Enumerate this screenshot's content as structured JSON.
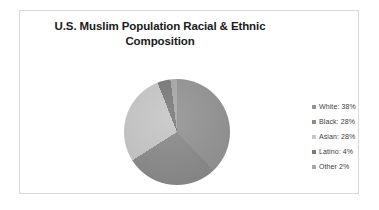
{
  "chart": {
    "title": "U.S. Muslim Population Racial & Ethnic Composition",
    "frame_border_color": "#d9d9d9",
    "background": "#ffffff"
  },
  "legend": {
    "position": "right",
    "items": [
      {
        "label": "White: 38%",
        "color": "#949494",
        "marker": "square-marker"
      },
      {
        "label": "Black: 28%",
        "color": "#8a8a8a",
        "marker": "square-marker"
      },
      {
        "label": "Asian: 28%",
        "color": "#c6c6c6",
        "marker": "square-marker"
      },
      {
        "label": "Latino: 4%",
        "color": "#7a7a7a",
        "marker": "square-marker"
      },
      {
        "label": "Other 2%",
        "color": "#a8a8a8",
        "marker": "square-marker"
      }
    ]
  },
  "chart_data": {
    "type": "pie",
    "title": "U.S. Muslim Population Racial & Ethnic Composition",
    "xlabel": "",
    "ylabel": "",
    "categories": [
      "White",
      "Black",
      "Asian",
      "Latino",
      "Other"
    ],
    "values": [
      38,
      28,
      28,
      4,
      2
    ],
    "unit": "percent",
    "labels": [
      "White: 38%",
      "Black: 28%",
      "Asian: 28%",
      "Latino: 4%",
      "Other 2%"
    ],
    "colors": [
      "#949494",
      "#8a8a8a",
      "#c6c6c6",
      "#7a7a7a",
      "#a8a8a8"
    ],
    "start_angle_deg": 0,
    "direction": "clockwise",
    "legend_position": "right",
    "grid": false,
    "data_labels_shown": false
  }
}
